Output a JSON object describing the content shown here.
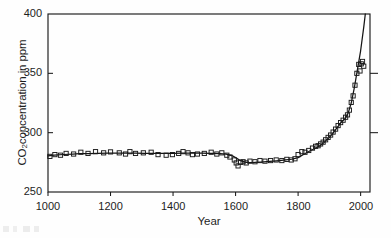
{
  "figure": {
    "background_color": "#ffffff",
    "ink_color": "#1a1a1a",
    "artifact_note": "faint scan smudge"
  },
  "chart_data": {
    "type": "line",
    "title": "",
    "subtitle": "",
    "xlabel": "Year",
    "ylabel": "CO2concentration in ppm",
    "ylabel_parts": {
      "prefix": "CO",
      "subscript": "2",
      "suffix": "concentration in ppm"
    },
    "xlim": [
      1000,
      2030
    ],
    "ylim": [
      250,
      400
    ],
    "xticks": [
      1000,
      1200,
      1400,
      1600,
      1800,
      2000
    ],
    "xtick_labels": [
      "1000",
      "1200",
      "1400",
      "1600",
      "1800",
      "2000"
    ],
    "yticks": [
      250,
      300,
      350,
      400
    ],
    "ytick_labels": [
      "250",
      "300",
      "350",
      "400"
    ],
    "grid": false,
    "legend": null,
    "legend_position": "none",
    "units": "ppm",
    "series": [
      {
        "name": "CO2 record (smoothed line)",
        "style": "solid-line",
        "color": "#141414",
        "x": [
          1000,
          1020,
          1050,
          1080,
          1100,
          1130,
          1160,
          1190,
          1220,
          1250,
          1280,
          1310,
          1340,
          1370,
          1400,
          1430,
          1460,
          1490,
          1520,
          1550,
          1570,
          1590,
          1600,
          1610,
          1620,
          1630,
          1640,
          1660,
          1680,
          1700,
          1720,
          1740,
          1760,
          1780,
          1800,
          1820,
          1840,
          1860,
          1870,
          1880,
          1890,
          1900,
          1910,
          1920,
          1930,
          1940,
          1950,
          1960,
          1970,
          1980,
          1990,
          2000,
          2010,
          2015
        ],
        "y": [
          280.5,
          281.0,
          281.6,
          282.0,
          282.3,
          282.4,
          282.5,
          282.7,
          282.8,
          282.8,
          282.7,
          282.6,
          282.6,
          282.6,
          282.6,
          282.7,
          282.8,
          282.7,
          282.6,
          282.4,
          282.0,
          280.5,
          279.0,
          277.3,
          276.0,
          275.2,
          274.8,
          274.9,
          275.2,
          275.6,
          276.0,
          276.5,
          277.0,
          277.6,
          279.0,
          282.0,
          285.0,
          287.5,
          289.0,
          291.0,
          293.5,
          296.0,
          299.0,
          302.5,
          306.0,
          309.5,
          311.5,
          316.5,
          325.0,
          338.0,
          353.5,
          369.0,
          389.0,
          400.0
        ]
      },
      {
        "name": "CO2 measurements (ice core + direct)",
        "style": "open-square-markers",
        "color": "#1a1a1a",
        "marker": "square-open",
        "x": [
          1006,
          1022,
          1040,
          1058,
          1082,
          1105,
          1128,
          1152,
          1178,
          1200,
          1228,
          1248,
          1262,
          1280,
          1305,
          1330,
          1352,
          1378,
          1398,
          1418,
          1432,
          1448,
          1462,
          1478,
          1500,
          1522,
          1540,
          1556,
          1572,
          1582,
          1596,
          1602,
          1608,
          1616,
          1624,
          1634,
          1646,
          1662,
          1678,
          1694,
          1712,
          1730,
          1748,
          1764,
          1778,
          1790,
          1800,
          1812,
          1822,
          1834,
          1846,
          1856,
          1864,
          1872,
          1880,
          1888,
          1896,
          1904,
          1912,
          1920,
          1928,
          1936,
          1944,
          1952,
          1958,
          1964,
          1970,
          1976,
          1982,
          1988,
          1994,
          1998,
          2002,
          2006,
          2010
        ],
        "y": [
          280.0,
          281.5,
          281.0,
          282.5,
          282.0,
          283.5,
          282.5,
          284.0,
          283.0,
          283.8,
          283.0,
          282.0,
          284.0,
          282.5,
          283.0,
          283.5,
          281.5,
          281.0,
          281.5,
          282.5,
          284.0,
          283.0,
          281.5,
          282.0,
          282.5,
          283.5,
          282.0,
          283.0,
          281.0,
          279.5,
          277.0,
          274.5,
          272.0,
          275.0,
          275.5,
          274.5,
          276.0,
          275.5,
          276.5,
          276.0,
          276.5,
          277.0,
          276.5,
          277.5,
          277.0,
          278.0,
          281.5,
          284.0,
          283.5,
          285.0,
          287.0,
          288.5,
          289.0,
          290.5,
          292.0,
          294.0,
          296.0,
          298.0,
          300.5,
          303.0,
          306.0,
          308.5,
          310.5,
          313.0,
          315.0,
          319.0,
          325.5,
          331.0,
          340.0,
          350.0,
          357.5,
          352.0,
          358.0,
          360.0,
          356.0
        ]
      }
    ]
  }
}
